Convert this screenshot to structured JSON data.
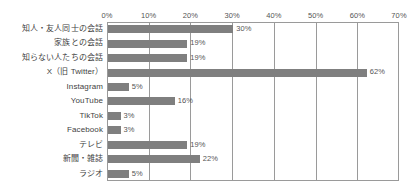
{
  "chart_data": {
    "type": "bar",
    "orientation": "horizontal",
    "title": "",
    "xlabel": "",
    "ylabel": "",
    "xlim": [
      0,
      70
    ],
    "xtick_labels": [
      "0%",
      "10%",
      "20%",
      "30%",
      "40%",
      "50%",
      "60%",
      "70%"
    ],
    "xticks": [
      0,
      10,
      20,
      30,
      40,
      50,
      60,
      70
    ],
    "grid": true,
    "grid_axis": "x",
    "legend": false,
    "bar_color": "#7f7f7f",
    "frame_color": "#9a9a9a",
    "value_suffix": "%",
    "categories": [
      "知人・友人同士の会話",
      "家族との会話",
      "知らない人たちの会話",
      "X（旧 Twitter）",
      "Instagram",
      "YouTube",
      "TikTok",
      "Facebook",
      "テレビ",
      "新聞・雑誌",
      "ラジオ"
    ],
    "values": [
      30,
      19,
      19,
      62,
      5,
      16,
      3,
      3,
      19,
      22,
      5
    ],
    "value_labels": [
      "30%",
      "19%",
      "19%",
      "62%",
      "5%",
      "16%",
      "3%",
      "3%",
      "19%",
      "22%",
      "5%"
    ]
  }
}
